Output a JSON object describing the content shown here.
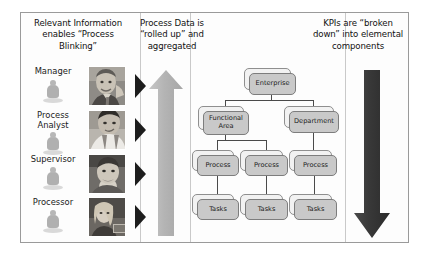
{
  "diagram": {
    "columns": {
      "left_heading": "Relevant Information enables “Process Blinking”",
      "middle_heading": "Process Data is “rolled up” and aggregated",
      "right_heading": "KPIs are “broken down” into elemental components"
    },
    "roles": [
      {
        "label": "Manager",
        "figurine": "person-figurine-icon",
        "photo": "manager-photo",
        "chevron": "chevron-right-icon"
      },
      {
        "label": "Process Analyst",
        "figurine": "person-figurine-icon",
        "photo": "process-analyst-photo",
        "chevron": "chevron-right-icon"
      },
      {
        "label": "Supervisor",
        "figurine": "person-figurine-icon",
        "photo": "supervisor-photo",
        "chevron": "chevron-right-icon"
      },
      {
        "label": "Processor",
        "figurine": "person-figurine-icon",
        "photo": "processor-photo",
        "chevron": "chevron-right-icon"
      }
    ],
    "arrows": {
      "up": {
        "name": "up-arrow-rolled-up",
        "direction": "up",
        "color": "#b6b6b6"
      },
      "down": {
        "name": "down-arrow-broken-down",
        "direction": "down",
        "color": "#3a3a3a"
      }
    },
    "hierarchy": {
      "levels": [
        {
          "level": 1,
          "nodes": [
            "Enterprise"
          ]
        },
        {
          "level": 2,
          "nodes": [
            "Functional Area",
            "Department"
          ]
        },
        {
          "level": 3,
          "nodes": [
            "Process",
            "Process",
            "Process"
          ]
        },
        {
          "level": 4,
          "nodes": [
            "Tasks",
            "Tasks",
            "Tasks"
          ]
        }
      ],
      "enterprise": "Enterprise",
      "functional_area": "Functional Area",
      "department": "Department",
      "process_0": "Process",
      "process_1": "Process",
      "process_2": "Process",
      "tasks_0": "Tasks",
      "tasks_1": "Tasks",
      "tasks_2": "Tasks"
    },
    "colors": {
      "frame_border": "#9a9a9a",
      "node_fill": "#c9c9c9",
      "node_back_fill": "#f2f2f2",
      "node_border": "#7d7d7d",
      "up_arrow": "#b6b6b6",
      "down_arrow": "#3a3a3a",
      "text": "#1a1a1a",
      "background": "#ffffff"
    }
  }
}
